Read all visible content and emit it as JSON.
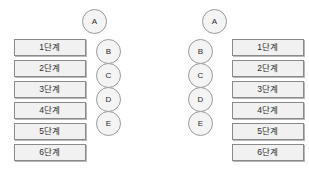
{
  "diagram": {
    "background_color": "#ffffff",
    "box_fill_color": "#f1f1f1",
    "box_border_color": "#8a8a8a",
    "circle_fill_color": "#f4f4f4",
    "circle_border_color": "#9a9a9a",
    "text_color": "#2b2b2b",
    "panels": [
      {
        "id": "left",
        "boxes": [
          {
            "label": "1단계"
          },
          {
            "label": "2단계"
          },
          {
            "label": "3단계"
          },
          {
            "label": "4단계"
          },
          {
            "label": "5단계"
          },
          {
            "label": "6단계"
          }
        ],
        "circles": [
          {
            "label": "A"
          },
          {
            "label": "B"
          },
          {
            "label": "C"
          },
          {
            "label": "D"
          },
          {
            "label": "E"
          }
        ]
      },
      {
        "id": "right",
        "boxes": [
          {
            "label": "1단계"
          },
          {
            "label": "2단계"
          },
          {
            "label": "3단계"
          },
          {
            "label": "4단계"
          },
          {
            "label": "5단계"
          },
          {
            "label": "6단계"
          }
        ],
        "circles": [
          {
            "label": "A"
          },
          {
            "label": "B"
          },
          {
            "label": "C"
          },
          {
            "label": "D"
          },
          {
            "label": "E"
          }
        ]
      }
    ]
  }
}
